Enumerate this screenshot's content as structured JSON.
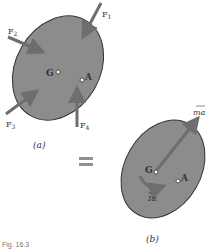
{
  "figure": {
    "caption": "Fig. 16.3",
    "colors": {
      "body_fill": "#8c8c8c",
      "body_stroke": "#333333",
      "arrow": "#6e6e6e",
      "equals": "#909090",
      "text": "#333333"
    },
    "panel_a": {
      "label": "(a)",
      "forces": [
        {
          "name": "F",
          "sub": "1"
        },
        {
          "name": "F",
          "sub": "2"
        },
        {
          "name": "F",
          "sub": "3"
        },
        {
          "name": "F",
          "sub": "4"
        }
      ],
      "points": {
        "G": "G",
        "A": "A"
      }
    },
    "equals_sign": "=",
    "panel_b": {
      "label": "(b)",
      "vector_label": "ma",
      "moment_label": "Iα",
      "points": {
        "G": "G",
        "A": "A"
      }
    }
  }
}
